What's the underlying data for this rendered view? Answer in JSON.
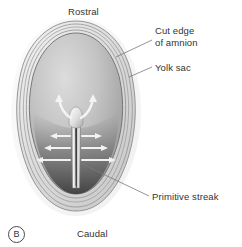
{
  "figure": {
    "panel_letter": "B",
    "orientation": {
      "top_label": "Rostral",
      "bottom_label": "Caudal"
    },
    "labels": {
      "cut_edge_of_amnion": "Cut edge\nof amnion",
      "yolk_sac": "Yolk sac",
      "primitive_streak": "Primitive streak"
    },
    "colors": {
      "background": "#ffffff",
      "outline": "#6e6e6e",
      "amnion_ring_light": "#e4e4e4",
      "amnion_ring_mid": "#cfcfcf",
      "disc_light": "#d6d6d6",
      "disc_mid": "#b4b4b4",
      "disc_dark": "#5f5f5f",
      "streak_highlight": "#f2f2f2",
      "streak_groove": "#3d3d3d",
      "arrow": "#f4f4f4",
      "leader_line": "#7a7a7a",
      "text": "#333333"
    },
    "structures": [
      "yolk sac outer membrane",
      "cut edge of amnion",
      "embryonic disc",
      "primitive streak",
      "primitive node",
      "cell migration arrows"
    ],
    "arrow_counts": {
      "node_curved_arrows": 2,
      "left_lateral_arrows": 3,
      "right_lateral_arrows": 3
    }
  }
}
